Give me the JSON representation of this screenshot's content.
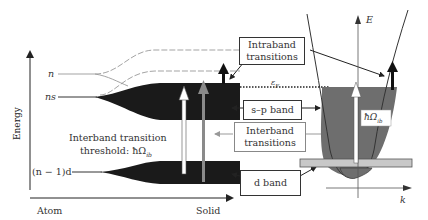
{
  "diagram": {
    "axis": {
      "energy_label": "Energy",
      "x_left_label": "Atom",
      "x_right_label": "Solid"
    },
    "levels": {
      "n": "n",
      "ns": "ns",
      "n_minus_1_d": "(n − 1)d"
    },
    "threshold": {
      "line1": "Interband transition",
      "line2": "threshold: ħΩ",
      "subscript": "ib"
    },
    "boxes": {
      "intraband": [
        "Intraband",
        "transitions"
      ],
      "sp_band": "s–p band",
      "interband": [
        "Interband",
        "transitions"
      ],
      "d_band": "d band"
    },
    "fermi_label": "ε",
    "fermi_subscript": "F",
    "parabola": {
      "y_axis": "E",
      "x_axis": "k",
      "inner_label": "ħΩ",
      "inner_subscript": "ib"
    },
    "colors": {
      "band_fill": "#1a1a1a",
      "parabola_fill": "#6e6e6e",
      "d_strip": "#c8c8c8",
      "gray_arrow": "#8a8a8a"
    }
  }
}
